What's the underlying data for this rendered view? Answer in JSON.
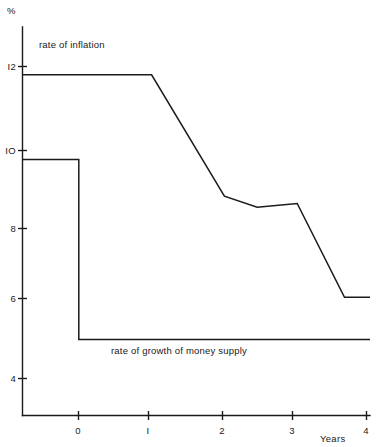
{
  "chart_data": {
    "type": "line",
    "title": "",
    "subtitle": "",
    "xlabel": "Years",
    "ylabel": "%",
    "xlim": [
      -0.78,
      4.0
    ],
    "ylim": [
      3.05,
      13.6
    ],
    "grid": false,
    "legend_position": "inline-annotations",
    "x_ticks": [
      {
        "value": 0,
        "label": "0"
      },
      {
        "value": 1,
        "label": "I"
      },
      {
        "value": 2,
        "label": "2"
      },
      {
        "value": 3,
        "label": "3"
      },
      {
        "value": 4,
        "label": "4"
      }
    ],
    "y_ticks": [
      {
        "value": 12,
        "label": "I2"
      },
      {
        "value": 10,
        "label": "IO"
      },
      {
        "value": 8,
        "label": "8"
      },
      {
        "value": 6,
        "label": "6"
      },
      {
        "value": 4,
        "label": "4"
      }
    ],
    "series": [
      {
        "name": "rate of inflation",
        "annotation": "rate of inflation",
        "color": "#1a1a1a",
        "points": [
          {
            "x": -0.78,
            "y": 12.3
          },
          {
            "x": 1.0,
            "y": 12.3
          },
          {
            "x": 2.0,
            "y": 9.0
          },
          {
            "x": 2.45,
            "y": 8.7
          },
          {
            "x": 3.0,
            "y": 8.8
          },
          {
            "x": 3.65,
            "y": 6.25
          },
          {
            "x": 4.0,
            "y": 6.25
          }
        ]
      },
      {
        "name": "rate of growth of money supply",
        "annotation": "rate of growth of money supply",
        "color": "#1a1a1a",
        "points": [
          {
            "x": -0.78,
            "y": 10.0
          },
          {
            "x": 0.0,
            "y": 10.0
          },
          {
            "x": 0.0,
            "y": 5.1
          },
          {
            "x": 4.0,
            "y": 5.1
          }
        ]
      }
    ]
  },
  "labels": {
    "y_axis_title": "%",
    "x_axis_title": "Years",
    "inflation_annotation": "rate of inflation",
    "money_supply_annotation": "rate of growth of money supply",
    "y_tick_12": "I2",
    "y_tick_10": "IO",
    "y_tick_8": "8",
    "y_tick_6": "6",
    "y_tick_4": "4",
    "x_tick_0": "0",
    "x_tick_1": "I",
    "x_tick_2": "2",
    "x_tick_3": "3",
    "x_tick_4": "4"
  },
  "colors": {
    "background": "#ffffff",
    "ink": "#1a1a1a"
  }
}
